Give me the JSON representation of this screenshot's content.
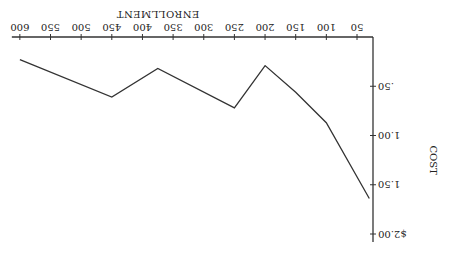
{
  "chart_data": {
    "type": "line",
    "title": "",
    "xlabel": "ENROLLMENT",
    "ylabel": "COST",
    "orientation_note": "image rotated 180 degrees",
    "x_ticks": [
      50,
      100,
      150,
      200,
      250,
      300,
      350,
      400,
      450,
      500,
      550,
      600
    ],
    "y_ticks": [
      ".50",
      "1.00",
      "1.50",
      "$2.00"
    ],
    "y_tick_values": [
      0.5,
      1.0,
      1.5,
      2.0
    ],
    "xlim": [
      0,
      600
    ],
    "ylim": [
      0,
      2.0
    ],
    "grid": false,
    "legend": null,
    "series": [
      {
        "name": "Cost per student",
        "x": [
          30,
          100,
          150,
          200,
          250,
          375,
          450,
          600
        ],
        "y": [
          1.64,
          0.87,
          0.56,
          0.29,
          0.72,
          0.32,
          0.61,
          0.23
        ]
      }
    ]
  }
}
